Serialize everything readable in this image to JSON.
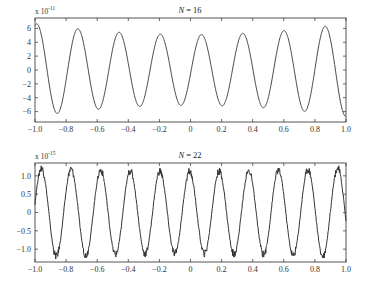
{
  "chart_data": [
    {
      "type": "line",
      "title": "N = 16",
      "title_var": "N",
      "title_value": "16",
      "multiplier_label": "x 10",
      "multiplier_exponent": "-11",
      "xlabel": "",
      "ylabel": "",
      "xlim": [
        -1.0,
        1.0
      ],
      "ylim": [
        -7.5,
        7.5
      ],
      "x_ticks": [
        "-1.0",
        "-0.8",
        "-0.6",
        "-0.4",
        "-0.2",
        "0",
        "0.2",
        "0.4",
        "0.6",
        "0.8",
        "1.0"
      ],
      "x_tick_values": [
        -1.0,
        -0.8,
        -0.6,
        -0.4,
        -0.2,
        0,
        0.2,
        0.4,
        0.6,
        0.8,
        1.0
      ],
      "y_ticks": [
        "6",
        "4",
        "2",
        "0",
        "-2",
        "-4",
        "-6"
      ],
      "y_tick_values": [
        6,
        4,
        2,
        0,
        -2,
        -4,
        -6
      ],
      "grid": false,
      "series": [
        {
          "name": "error",
          "description": "smooth oscillation ~7.5 periods, amplitude ~6.5 at ends, ~5.2 at center",
          "periods": 7.55,
          "phase": 1.3,
          "amp_edge": 6.7,
          "amp_center": 5.1,
          "noise": 0,
          "peaks": [
            {
              "x": -0.8,
              "y": 6.5
            },
            {
              "x": -0.55,
              "y": 6.0
            },
            {
              "x": -0.3,
              "y": 5.5
            },
            {
              "x": -0.05,
              "y": 5.1
            },
            {
              "x": 0.2,
              "y": 5.4
            },
            {
              "x": 0.45,
              "y": 6.0
            },
            {
              "x": 0.7,
              "y": 6.5
            },
            {
              "x": 0.96,
              "y": 6.8
            }
          ],
          "troughs": [
            {
              "x": -0.92,
              "y": -6.8
            },
            {
              "x": -0.67,
              "y": -6.3
            },
            {
              "x": -0.42,
              "y": -5.7
            },
            {
              "x": -0.17,
              "y": -5.3
            },
            {
              "x": 0.08,
              "y": -5.2
            },
            {
              "x": 0.33,
              "y": -5.6
            },
            {
              "x": 0.58,
              "y": -6.2
            },
            {
              "x": 0.83,
              "y": -6.6
            }
          ]
        }
      ]
    },
    {
      "type": "line",
      "title": "N = 22",
      "title_var": "N",
      "title_value": "22",
      "multiplier_label": "x 10",
      "multiplier_exponent": "-15",
      "xlabel": "",
      "ylabel": "",
      "xlim": [
        -1.0,
        1.0
      ],
      "ylim": [
        -1.35,
        1.35
      ],
      "x_ticks": [
        "-1.0",
        "-0.8",
        "-0.6",
        "-0.4",
        "-0.2",
        "0",
        "0.2",
        "0.4",
        "0.6",
        "0.8",
        "1.0"
      ],
      "x_tick_values": [
        -1.0,
        -0.8,
        -0.6,
        -0.4,
        -0.2,
        0,
        0.2,
        0.4,
        0.6,
        0.8,
        1.0
      ],
      "y_ticks": [
        "1.0",
        "0.5",
        "0",
        "-0.5",
        "-1.0"
      ],
      "y_tick_values": [
        1.0,
        0.5,
        0,
        -0.5,
        -1.0
      ],
      "grid": false,
      "series": [
        {
          "name": "error",
          "description": "oscillation ~10.5 periods with rounding noise, amplitude ~1.15",
          "periods": 10.5,
          "phase": 0.2,
          "amp_edge": 1.22,
          "amp_center": 1.12,
          "noise": 0.06
        }
      ]
    }
  ]
}
